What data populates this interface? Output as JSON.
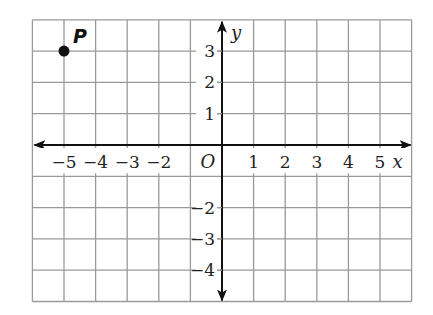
{
  "figure": {
    "type": "coordinate-plane",
    "x_axis_label": "x",
    "y_axis_label": "y",
    "origin_label": "O",
    "x_range": [
      -6,
      6
    ],
    "y_range": [
      -5,
      4
    ],
    "x_tick_labels": [
      {
        "value": -5,
        "text": "−5"
      },
      {
        "value": -4,
        "text": "−4"
      },
      {
        "value": -3,
        "text": "−3"
      },
      {
        "value": -2,
        "text": "−2"
      },
      {
        "value": 1,
        "text": "1"
      },
      {
        "value": 2,
        "text": "2"
      },
      {
        "value": 3,
        "text": "3"
      },
      {
        "value": 4,
        "text": "4"
      },
      {
        "value": 5,
        "text": "5"
      }
    ],
    "y_tick_labels": [
      {
        "value": 3,
        "text": "3"
      },
      {
        "value": 2,
        "text": "2"
      },
      {
        "value": 1,
        "text": "1"
      },
      {
        "value": -2,
        "text": "−2"
      },
      {
        "value": -3,
        "text": "−3"
      },
      {
        "value": -4,
        "text": "−4"
      }
    ],
    "points": [
      {
        "label": "P",
        "x": -5,
        "y": 3
      }
    ],
    "colors": {
      "grid": "#9a9a9a",
      "axis": "#111111",
      "point": "#111111",
      "background": "#ffffff"
    }
  },
  "chart_data": {
    "type": "scatter",
    "title": "",
    "xlabel": "x",
    "ylabel": "y",
    "xlim": [
      -6,
      6
    ],
    "ylim": [
      -5,
      4
    ],
    "grid": true,
    "series": [
      {
        "name": "P",
        "x": [
          -5
        ],
        "y": [
          3
        ]
      }
    ],
    "annotations": [
      "P",
      "O"
    ]
  }
}
